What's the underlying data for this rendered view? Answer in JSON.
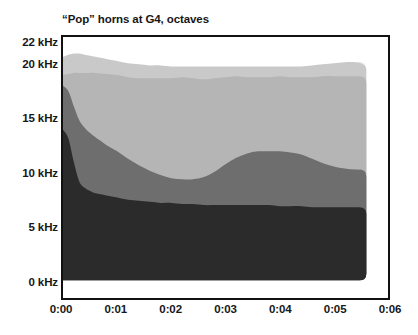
{
  "chart_data": {
    "type": "area",
    "title": "“Pop” horns at G4, octaves",
    "subtitle": "",
    "xlabel": "",
    "ylabel": "",
    "stacked": true,
    "grid": false,
    "legend_position": "none",
    "xlim": [
      0,
      6
    ],
    "ylim": [
      0,
      22
    ],
    "x_unit": "seconds (m:ss)",
    "y_unit": "kHz",
    "x_tick_values": [
      0,
      1,
      2,
      3,
      4,
      5,
      6
    ],
    "x_tick_labels": [
      "0:00",
      "0:01",
      "0:02",
      "0:03",
      "0:04",
      "0:05",
      "0:06"
    ],
    "y_tick_values": [
      0,
      5,
      10,
      15,
      20,
      22
    ],
    "y_tick_labels": [
      "0 kHz",
      "5 kHz",
      "10 kHz",
      "15 kHz",
      "20 kHz",
      "22 kHz"
    ],
    "data_end_x": 5.6,
    "x": [
      0.0,
      0.1,
      0.2,
      0.3,
      0.4,
      0.5,
      0.6,
      0.8,
      1.0,
      1.2,
      1.4,
      1.6,
      1.8,
      2.0,
      2.2,
      2.4,
      2.6,
      2.8,
      3.0,
      3.2,
      3.4,
      3.6,
      3.8,
      4.0,
      4.2,
      4.4,
      4.6,
      4.8,
      5.0,
      5.2,
      5.4,
      5.6
    ],
    "series": [
      {
        "name": "band-1-lowest",
        "color": "#2b2b2b",
        "cumulative_top": [
          14.0,
          13.2,
          11.0,
          9.2,
          8.6,
          8.3,
          8.1,
          7.9,
          7.7,
          7.5,
          7.4,
          7.3,
          7.2,
          7.2,
          7.1,
          7.1,
          7.0,
          7.0,
          7.0,
          7.0,
          7.0,
          7.0,
          7.0,
          6.9,
          6.9,
          6.9,
          6.8,
          6.8,
          6.8,
          6.8,
          6.8,
          6.8
        ]
      },
      {
        "name": "band-2-low-mid",
        "color": "#6e6e6e",
        "cumulative_top": [
          18.1,
          17.6,
          16.2,
          14.9,
          14.2,
          13.7,
          13.3,
          12.6,
          12.0,
          11.3,
          10.7,
          10.2,
          9.8,
          9.5,
          9.4,
          9.4,
          9.6,
          10.1,
          10.8,
          11.4,
          11.8,
          12.0,
          12.0,
          12.0,
          11.9,
          11.7,
          11.3,
          10.9,
          10.6,
          10.4,
          10.3,
          10.3
        ]
      },
      {
        "name": "band-3-high-mid",
        "color": "#b5b5b5",
        "cumulative_top": [
          19.1,
          19.2,
          19.3,
          19.3,
          19.3,
          19.3,
          19.3,
          19.2,
          19.1,
          18.9,
          18.8,
          18.8,
          18.8,
          18.8,
          18.9,
          18.8,
          18.7,
          18.8,
          18.9,
          19.0,
          18.9,
          18.9,
          18.9,
          19.0,
          18.9,
          18.9,
          18.9,
          19.0,
          19.0,
          19.0,
          19.0,
          19.0
        ]
      },
      {
        "name": "band-4-highest",
        "color": "#c9c9c9",
        "cumulative_top": [
          20.8,
          21.0,
          21.1,
          21.1,
          21.0,
          20.9,
          20.8,
          20.6,
          20.4,
          20.2,
          20.1,
          20.0,
          20.0,
          19.9,
          19.9,
          19.9,
          19.9,
          19.9,
          19.9,
          19.9,
          19.9,
          19.9,
          19.9,
          19.9,
          19.9,
          19.9,
          20.0,
          20.1,
          20.2,
          20.3,
          20.3,
          20.2
        ]
      }
    ]
  },
  "axes": {
    "y_ticks": [
      {
        "label": "22 kHz",
        "value": 22
      },
      {
        "label": "20 kHz",
        "value": 20
      },
      {
        "label": "15 kHz",
        "value": 15
      },
      {
        "label": "10 kHz",
        "value": 10
      },
      {
        "label": "5 kHz",
        "value": 5
      },
      {
        "label": "0 kHz",
        "value": 0
      }
    ],
    "x_ticks": [
      {
        "label": "0:00",
        "value": 0
      },
      {
        "label": "0:01",
        "value": 1
      },
      {
        "label": "0:02",
        "value": 2
      },
      {
        "label": "0:03",
        "value": 3
      },
      {
        "label": "0:04",
        "value": 4
      },
      {
        "label": "0:05",
        "value": 5
      },
      {
        "label": "0:06",
        "value": 6
      }
    ]
  },
  "colors": {
    "frame": "#111111",
    "background": "#ffffff",
    "text": "#171717",
    "band_1": "#2b2b2b",
    "band_2": "#6e6e6e",
    "band_3": "#b5b5b5",
    "band_4": "#c9c9c9"
  }
}
